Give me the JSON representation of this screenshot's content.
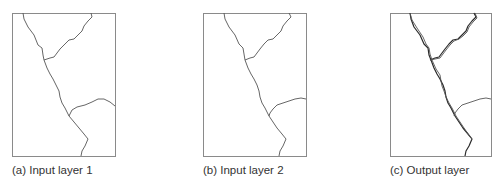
{
  "figure": {
    "panels": [
      {
        "id": "a",
        "caption": "(a) Input layer 1"
      },
      {
        "id": "b",
        "caption": "(b) Input layer 2"
      },
      {
        "id": "c",
        "caption": "(c) Output layer"
      }
    ]
  },
  "colors": {
    "frame": "#8a8a8a",
    "line": "#555555",
    "overlay_line": "#2a2a2a",
    "text": "#333333"
  }
}
